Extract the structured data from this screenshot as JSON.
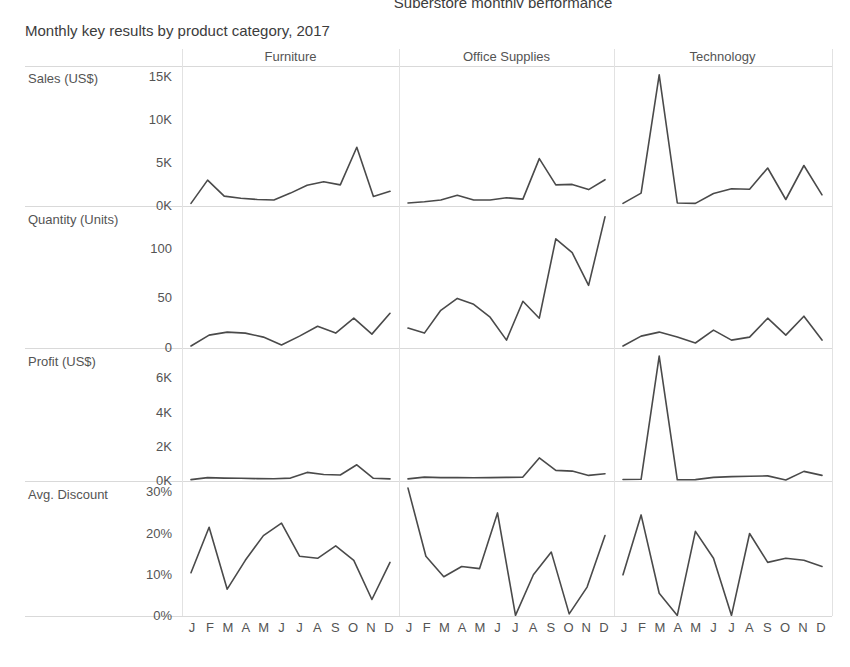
{
  "header": {
    "clipped_title": "Superstore monthly performance",
    "subtitle": "Monthly key results by product category, 2017"
  },
  "columns": [
    {
      "label": "Furniture",
      "key": "furniture"
    },
    {
      "label": "Office Supplies",
      "key": "office_supplies"
    },
    {
      "label": "Technology",
      "key": "technology"
    }
  ],
  "rows": [
    {
      "label": "Sales (US$)",
      "key": "sales"
    },
    {
      "label": "Quantity (Units)",
      "key": "quantity"
    },
    {
      "label": "Profit (US$)",
      "key": "profit"
    },
    {
      "label": "Avg. Discount",
      "key": "discount"
    }
  ],
  "months": [
    "J",
    "F",
    "M",
    "A",
    "M",
    "J",
    "J",
    "A",
    "S",
    "O",
    "N",
    "D"
  ],
  "colors": {
    "line": "#4a4a4a",
    "gridline": "#d9d9d9",
    "panel_divider": "#e2e2e2",
    "text": "#545454",
    "background": "#ffffff"
  },
  "chart_data": {
    "type": "line",
    "title": "Monthly key results by product category, 2017",
    "xlabel": "",
    "ylabel": "",
    "grid": true,
    "legend": "none",
    "layout": "small-multiples 4 rows x 3 columns",
    "x": [
      "J",
      "F",
      "M",
      "A",
      "M",
      "J",
      "J",
      "A",
      "S",
      "O",
      "N",
      "D"
    ],
    "panels": [
      {
        "row": "Sales (US$)",
        "column": "Furniture",
        "ylim": [
          0,
          16000
        ],
        "yticks": [
          0,
          5000,
          10000,
          15000
        ],
        "yticklabels": [
          "0K",
          "5K",
          "10K",
          "15K"
        ],
        "values": [
          300,
          3000,
          1150,
          900,
          750,
          700,
          1500,
          2400,
          2800,
          2450,
          6800,
          1100,
          1700
        ]
      },
      {
        "row": "Sales (US$)",
        "column": "Office Supplies",
        "ylim": [
          0,
          16000
        ],
        "yticks": [
          0,
          5000,
          10000,
          15000
        ],
        "yticklabels": [
          "0K",
          "5K",
          "10K",
          "15K"
        ],
        "values": [
          350,
          500,
          700,
          1250,
          700,
          700,
          950,
          800,
          5500,
          2450,
          2500,
          1900,
          3050
        ]
      },
      {
        "row": "Sales (US$)",
        "column": "Technology",
        "ylim": [
          0,
          16000
        ],
        "yticks": [
          0,
          5000,
          10000,
          15000
        ],
        "yticklabels": [
          "0K",
          "5K",
          "10K",
          "15K"
        ],
        "values": [
          300,
          1500,
          15200,
          350,
          300,
          1450,
          2000,
          1950,
          4400,
          750,
          4700,
          1300
        ]
      },
      {
        "row": "Quantity (Units)",
        "column": "Furniture",
        "ylim": [
          0,
          140
        ],
        "yticks": [
          0,
          50,
          100
        ],
        "yticklabels": [
          "0",
          "50",
          "100"
        ],
        "values": [
          2,
          13,
          16,
          15,
          11,
          3,
          12,
          22,
          15,
          30,
          14,
          35
        ]
      },
      {
        "row": "Quantity (Units)",
        "column": "Office Supplies",
        "ylim": [
          0,
          140
        ],
        "yticks": [
          0,
          50,
          100
        ],
        "yticklabels": [
          "0",
          "50",
          "100"
        ],
        "values": [
          20,
          15,
          38,
          50,
          44,
          31,
          8,
          47,
          30,
          110,
          96,
          63,
          132
        ]
      },
      {
        "row": "Quantity (Units)",
        "column": "Technology",
        "ylim": [
          0,
          140
        ],
        "yticks": [
          0,
          50,
          100
        ],
        "yticklabels": [
          "0",
          "50",
          "100"
        ],
        "values": [
          2,
          12,
          16,
          11,
          5,
          18,
          8,
          11,
          30,
          13,
          32,
          8
        ]
      },
      {
        "row": "Profit (US$)",
        "column": "Furniture",
        "ylim": [
          0,
          7600
        ],
        "yticks": [
          0,
          2000,
          4000,
          6000
        ],
        "yticklabels": [
          "0K",
          "2K",
          "4K",
          "6K"
        ],
        "values": [
          80,
          200,
          170,
          160,
          140,
          130,
          170,
          500,
          380,
          350,
          950,
          160,
          120
        ]
      },
      {
        "row": "Profit (US$)",
        "column": "Office Supplies",
        "ylim": [
          0,
          7600
        ],
        "yticks": [
          0,
          2000,
          4000,
          6000
        ],
        "yticklabels": [
          "0K",
          "2K",
          "4K",
          "6K"
        ],
        "values": [
          120,
          230,
          200,
          200,
          190,
          200,
          210,
          230,
          1350,
          620,
          580,
          330,
          420
        ]
      },
      {
        "row": "Profit (US$)",
        "column": "Technology",
        "ylim": [
          0,
          7600
        ],
        "yticks": [
          0,
          2000,
          4000,
          6000
        ],
        "yticklabels": [
          "0K",
          "2K",
          "4K",
          "6K"
        ],
        "values": [
          90,
          100,
          7300,
          70,
          80,
          210,
          260,
          280,
          300,
          60,
          560,
          330
        ]
      },
      {
        "row": "Avg. Discount",
        "column": "Furniture",
        "ylim": [
          0,
          32
        ],
        "yticks": [
          0,
          10,
          20,
          30
        ],
        "yticklabels": [
          "0%",
          "10%",
          "20%",
          "30%"
        ],
        "unit": "%",
        "values": [
          10.5,
          21.5,
          6.5,
          13.5,
          19.5,
          22.5,
          14.5,
          14.0,
          17.0,
          13.5,
          4.0,
          13.0
        ]
      },
      {
        "row": "Avg. Discount",
        "column": "Office Supplies",
        "ylim": [
          0,
          32
        ],
        "yticks": [
          0,
          10,
          20,
          30
        ],
        "yticklabels": [
          "0%",
          "10%",
          "20%",
          "30%"
        ],
        "unit": "%",
        "values": [
          31.0,
          14.5,
          9.5,
          12.0,
          11.5,
          25.0,
          0.0,
          10.0,
          15.5,
          0.5,
          7.0,
          19.5
        ]
      },
      {
        "row": "Avg. Discount",
        "column": "Technology",
        "ylim": [
          0,
          32
        ],
        "yticks": [
          0,
          10,
          20,
          30
        ],
        "yticklabels": [
          "0%",
          "10%",
          "20%",
          "30%"
        ],
        "unit": "%",
        "values": [
          10.0,
          24.5,
          5.5,
          0.0,
          20.5,
          14.0,
          0.0,
          20.0,
          13.0,
          14.0,
          13.5,
          12.0
        ]
      }
    ]
  }
}
